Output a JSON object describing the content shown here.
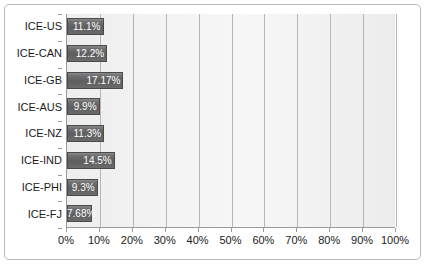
{
  "chart_data": {
    "type": "bar",
    "orientation": "horizontal",
    "title": "",
    "xlabel": "",
    "ylabel": "",
    "xlim": [
      0,
      100
    ],
    "grid": true,
    "legend": false,
    "categories": [
      "ICE-US",
      "ICE-CAN",
      "ICE-GB",
      "ICE-AUS",
      "ICE-NZ",
      "ICE-IND",
      "ICE-PHI",
      "ICE-FJ"
    ],
    "values": [
      11.1,
      12.2,
      17.17,
      9.9,
      11.3,
      14.5,
      9.3,
      7.68
    ],
    "data_labels": [
      "11.1%",
      "12.2%",
      "17.17%",
      "9.9%",
      "11.3%",
      "14.5%",
      "9.3%",
      "7.68%"
    ],
    "xticks": [
      0,
      10,
      20,
      30,
      40,
      50,
      60,
      70,
      80,
      90,
      100
    ],
    "xtick_labels": [
      "0%",
      "10%",
      "20%",
      "30%",
      "40%",
      "50%",
      "60%",
      "70%",
      "80%",
      "90%",
      "100%"
    ],
    "bar_color": "#5e5e5e",
    "bar_border_color": "#4a4a4a",
    "data_label_color": "#ffffff",
    "plot_background": "#f2f2f2",
    "gridline_color": "#b6b6b6",
    "axis_color": "#9a9a9a",
    "frame_border_color": "#b9b9b9"
  }
}
